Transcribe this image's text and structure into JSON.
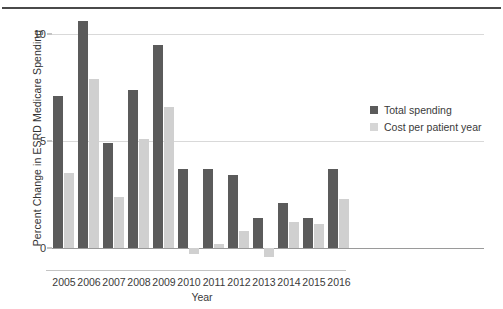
{
  "chart_data": {
    "type": "bar",
    "title": "",
    "xlabel": "Year",
    "ylabel": "Percent Change in ESRD Medicare Spending",
    "categories": [
      "2005",
      "2006",
      "2007",
      "2008",
      "2009",
      "2010",
      "2011",
      "2012",
      "2013",
      "2014",
      "2015",
      "2016"
    ],
    "series": [
      {
        "name": "Total spending",
        "color": "#5b5b5b",
        "values": [
          7.1,
          10.6,
          4.9,
          7.4,
          9.5,
          3.7,
          3.7,
          3.4,
          1.4,
          2.1,
          1.4,
          3.7
        ]
      },
      {
        "name": "Cost per patient year",
        "color": "#d0d0d0",
        "values": [
          3.5,
          7.9,
          2.4,
          5.1,
          6.6,
          -0.3,
          0.2,
          0.8,
          -0.4,
          1.2,
          1.1,
          2.3
        ]
      }
    ],
    "ylim": [
      -0.6,
      11.2
    ],
    "yticks": [
      0,
      5,
      10
    ],
    "ytick_labels": [
      "0",
      "5",
      "10"
    ],
    "grid": true,
    "legend_position": "right"
  },
  "legend": {
    "items": [
      {
        "label": "Total spending"
      },
      {
        "label": "Cost per patient year"
      }
    ]
  },
  "colors": {
    "total_spending": "#5b5b5b",
    "cost_per_patient_year": "#d0d0d0",
    "gridline": "#d9d9d9",
    "zero_line": "#9a9a9a",
    "text": "#3a3a3a",
    "top_rule": "#4a4a4a",
    "background": "#ffffff"
  }
}
